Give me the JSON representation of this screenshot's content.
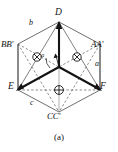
{
  "figure": {
    "caption": "(a)",
    "type": "hexagonal-vector-diagram",
    "colors": {
      "ink": "#141414",
      "thin_line": "#4a4a4a",
      "dashed": "#5a5a5a",
      "background": "#ffffff"
    },
    "vertices": {
      "top": "D",
      "bottom_left": "E",
      "bottom_right": "F"
    },
    "edge_labels": {
      "left_pair": "BB′",
      "right_pair": "AA′",
      "bottom_pair": "CC′"
    },
    "axis_labels": {
      "upper_left": "b",
      "right": "a",
      "lower_left": "c"
    },
    "angle_label": "α",
    "markers": [
      {
        "name": "cross-circle-left",
        "symbol": "⊗",
        "x": 37,
        "y": 57
      },
      {
        "name": "cross-circle-right",
        "symbol": "⊗",
        "x": 77,
        "y": 57
      },
      {
        "name": "cross-circle-bottom",
        "symbol": "⊕",
        "x": 59,
        "y": 90
      }
    ]
  }
}
